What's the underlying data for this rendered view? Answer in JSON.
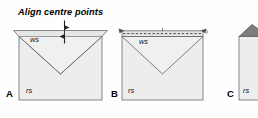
{
  "figure": {
    "type": "folding-diagram",
    "annotation": {
      "text": "Align centre points",
      "marker": "vertical-double-arrow"
    },
    "panels": [
      {
        "id": "A",
        "letter": "A",
        "labels": {
          "top": "ws",
          "bottom": "rs"
        },
        "features": [
          "trapezoid-flap",
          "v-fold-line",
          "alignment-arrow"
        ]
      },
      {
        "id": "B",
        "letter": "B",
        "labels": {
          "top": "ws",
          "bottom": "rs"
        },
        "features": [
          "trapezoid-flap",
          "v-fold-line",
          "dashed-fold-line",
          "corner-arrow-left",
          "corner-arrow-right"
        ]
      },
      {
        "id": "C",
        "letter": "C",
        "labels": {
          "top": "",
          "bottom": "rs"
        },
        "features": [
          "folded-corner-triangle",
          "clipped-right-edge"
        ]
      }
    ],
    "colors": {
      "paper_fill": "#ededed",
      "flap_fill": "#e3e3e3",
      "fold_dark": "#7d7d7d",
      "stroke": "#555555",
      "text": "#000000",
      "background": "#fefefe"
    }
  }
}
